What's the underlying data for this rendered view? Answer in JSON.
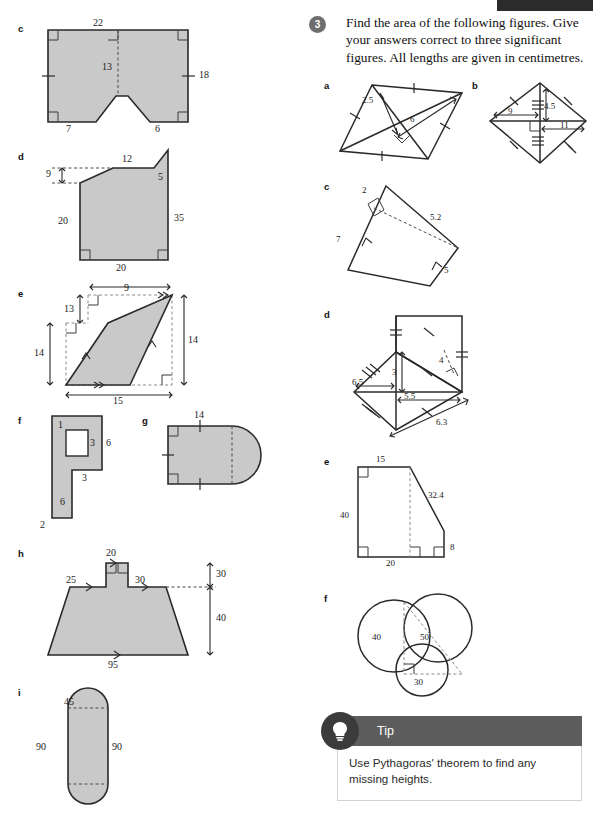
{
  "page": {
    "header_bar_present": true,
    "fill_color": "#c9c9c9",
    "stroke_color": "#2a2a2a",
    "badge_color": "#6e6e6e",
    "tip_header_color": "#5d5d5d"
  },
  "question": {
    "number": "3",
    "text": "Find the area of the following figures. Give your answers correct to three significant figures. All lengths are given in centimetres."
  },
  "tip": {
    "title": "Tip",
    "icon": "lightbulb-icon",
    "body": "Use Pythagoras' theorem to find any missing heights."
  },
  "left_column": {
    "figures": [
      {
        "label": "c",
        "description": "square with notch cut from bottom edge",
        "dimensions": [
          "22",
          "13",
          "18",
          "7",
          "6"
        ]
      },
      {
        "label": "d",
        "description": "quadrilateral with sloped top",
        "dimensions": [
          "12",
          "9",
          "5",
          "20",
          "35",
          "20"
        ]
      },
      {
        "label": "e",
        "description": "parallelogram slanted with dashed bounding box",
        "dimensions": [
          "9",
          "13",
          "14",
          "14",
          "15"
        ]
      },
      {
        "label": "f",
        "description": "P-shaped polygon with square hole",
        "dimensions": [
          "1",
          "3",
          "6",
          "3",
          "6",
          "2"
        ]
      },
      {
        "label": "g",
        "description": "rectangle with semicircular end",
        "dimensions": [
          "14"
        ]
      },
      {
        "label": "h",
        "description": "trapezium with chimney on top",
        "dimensions": [
          "20",
          "25",
          "30",
          "30",
          "40",
          "95"
        ]
      },
      {
        "label": "i",
        "description": "stadium shape, rectangle with semicircular ends",
        "dimensions": [
          "45",
          "90",
          "90"
        ]
      }
    ]
  },
  "right_column": {
    "figures": [
      {
        "label": "a",
        "description": "parallelogram with diagonal and perpendicular height",
        "dimensions": [
          "2.5",
          "6"
        ]
      },
      {
        "label": "b",
        "description": "kite / quadrilateral with diagonals",
        "dimensions": [
          "4.5",
          "9",
          "11"
        ]
      },
      {
        "label": "c",
        "description": "quadrilateral with dashed diagonal and perpendicular height",
        "dimensions": [
          "2",
          "5.2",
          "7",
          "5"
        ]
      },
      {
        "label": "d",
        "description": "compound kite with triangles",
        "dimensions": [
          "3",
          "4",
          "6.5",
          "5.5",
          "6.3"
        ]
      },
      {
        "label": "e",
        "description": "right trapezium outline with dashed height line",
        "dimensions": [
          "15",
          "32.4",
          "40",
          "8",
          "20"
        ]
      },
      {
        "label": "f",
        "description": "three overlapping circles with dashed right triangle",
        "dimensions": [
          "40",
          "50",
          "30"
        ]
      }
    ]
  }
}
